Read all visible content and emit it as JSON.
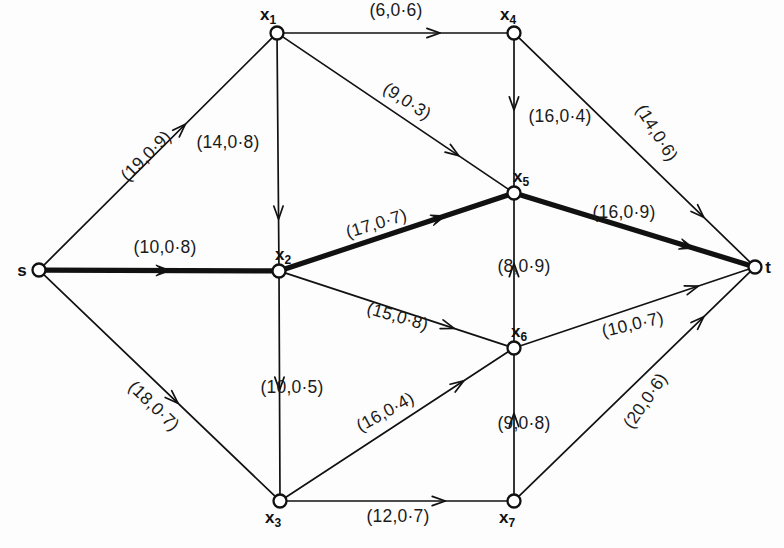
{
  "figure": {
    "type": "directed-network-flow-graph",
    "background_color": "#fdfdfd",
    "ink_color": "#111111",
    "label_format": "(capacity,reliability)",
    "width": 784,
    "height": 548
  },
  "nodes": [
    {
      "id": "s",
      "label": "s",
      "sub": "",
      "x": 39,
      "y": 270,
      "label_dx": -17,
      "label_dy": 6,
      "radius": 6.5
    },
    {
      "id": "x1",
      "label": "x",
      "sub": "1",
      "x": 277,
      "y": 33,
      "label_dx": -9,
      "label_dy": -13,
      "radius": 6.5
    },
    {
      "id": "x2",
      "label": "x",
      "sub": "2",
      "x": 279,
      "y": 271,
      "label_dx": 4,
      "label_dy": -11,
      "radius": 6.5
    },
    {
      "id": "x3",
      "label": "x",
      "sub": "3",
      "x": 280,
      "y": 501,
      "label_dx": -7,
      "label_dy": 22,
      "radius": 6.5
    },
    {
      "id": "x4",
      "label": "x",
      "sub": "4",
      "x": 514,
      "y": 33,
      "label_dx": -6,
      "label_dy": -13,
      "radius": 6.5
    },
    {
      "id": "x5",
      "label": "x",
      "sub": "5",
      "x": 514,
      "y": 193,
      "label_dx": 7,
      "label_dy": -11,
      "radius": 6.5
    },
    {
      "id": "x6",
      "label": "x",
      "sub": "6",
      "x": 514,
      "y": 348,
      "label_dx": 5,
      "label_dy": -11,
      "radius": 6.5
    },
    {
      "id": "x7",
      "label": "x",
      "sub": "7",
      "x": 514,
      "y": 501,
      "label_dx": -7,
      "label_dy": 22,
      "radius": 6.5
    },
    {
      "id": "t",
      "label": "t",
      "sub": "",
      "x": 755,
      "y": 267,
      "label_dx": 13,
      "label_dy": 6,
      "radius": 6.5
    }
  ],
  "edges": [
    {
      "id": "s-x1",
      "from": "s",
      "to": "x1",
      "capacity": 19,
      "reliability": 0.9,
      "label": "(19,0·0·9)",
      "label_text": "(19,0·9)",
      "bold": false,
      "label_x": 150,
      "label_y": 160,
      "rotate": -45,
      "arrow_t": 0.62
    },
    {
      "id": "s-x2",
      "from": "s",
      "to": "x2",
      "capacity": 10,
      "reliability": 0.8,
      "label_text": "(10,0·8)",
      "bold": true,
      "label_x": 165,
      "label_y": 253,
      "rotate": 0,
      "arrow_t": 0.55
    },
    {
      "id": "s-x3",
      "from": "s",
      "to": "x3",
      "capacity": 18,
      "reliability": 0.7,
      "label_text": "(18,0·7)",
      "bold": false,
      "label_x": 150,
      "label_y": 410,
      "rotate": 44,
      "arrow_t": 0.58
    },
    {
      "id": "x1-x4",
      "from": "x1",
      "to": "x4",
      "capacity": 6,
      "reliability": 0.6,
      "label_text": "(6,0·6)",
      "bold": false,
      "label_x": 396,
      "label_y": 16,
      "rotate": 0,
      "arrow_t": 0.7
    },
    {
      "id": "x1-x2",
      "from": "x1",
      "to": "x2",
      "capacity": 14,
      "reliability": 0.8,
      "label_text": "(14,0·8)",
      "bold": false,
      "label_x": 228,
      "label_y": 148,
      "rotate": 0,
      "arrow_t": 0.8
    },
    {
      "id": "x1-x5",
      "from": "x1",
      "to": "x5",
      "capacity": 9,
      "reliability": 0.3,
      "label_text": "(9,0·3)",
      "bold": false,
      "label_x": 404,
      "label_y": 106,
      "rotate": 33,
      "arrow_t": 0.78
    },
    {
      "id": "x4-x5",
      "from": "x4",
      "to": "x5",
      "capacity": 16,
      "reliability": 0.4,
      "label_text": "(16,0·4)",
      "bold": false,
      "label_x": 560,
      "label_y": 122,
      "rotate": 0,
      "arrow_t": 0.48
    },
    {
      "id": "x4-t",
      "from": "x4",
      "to": "t",
      "capacity": 14,
      "reliability": 0.6,
      "label_text": "(14,0·6)",
      "bold": false,
      "label_x": 652,
      "label_y": 136,
      "rotate": 58,
      "arrow_t": 0.8
    },
    {
      "id": "x2-x5",
      "from": "x2",
      "to": "x5",
      "capacity": 17,
      "reliability": 0.7,
      "label_text": "(17,0·7)",
      "bold": true,
      "label_x": 378,
      "label_y": 229,
      "rotate": -17,
      "arrow_t": 0.72
    },
    {
      "id": "x2-x6",
      "from": "x2",
      "to": "x6",
      "capacity": 15,
      "reliability": 0.8,
      "label_text": "(15,0·8)",
      "bold": false,
      "label_x": 396,
      "label_y": 322,
      "rotate": 16,
      "arrow_t": 0.76
    },
    {
      "id": "x2-x3",
      "from": "x2",
      "to": "x3",
      "capacity": 10,
      "reliability": 0.5,
      "label_text": "(10,0·5)",
      "bold": false,
      "label_x": 292,
      "label_y": 393,
      "rotate": 0,
      "arrow_t": 0.52
    },
    {
      "id": "x6-x5",
      "from": "x6",
      "to": "x5",
      "capacity": 8,
      "reliability": 0.9,
      "label_text": "(8,0·9)",
      "bold": false,
      "label_x": 524,
      "label_y": 272,
      "rotate": 0,
      "arrow_t": 0.55
    },
    {
      "id": "x5-t",
      "from": "x5",
      "to": "t",
      "capacity": 16,
      "reliability": 0.9,
      "label_text": "(16,0·9)",
      "bold": true,
      "label_x": 624,
      "label_y": 218,
      "rotate": 0,
      "arrow_t": 0.76
    },
    {
      "id": "x6-t",
      "from": "x6",
      "to": "t",
      "capacity": 10,
      "reliability": 0.7,
      "label_text": "(10,0·7)",
      "bold": false,
      "label_x": 634,
      "label_y": 330,
      "rotate": -13,
      "arrow_t": 0.78
    },
    {
      "id": "x3-x6",
      "from": "x3",
      "to": "x6",
      "capacity": 16,
      "reliability": 0.4,
      "label_text": "(16,0·4)",
      "bold": false,
      "label_x": 388,
      "label_y": 417,
      "rotate": -29,
      "arrow_t": 0.8
    },
    {
      "id": "x3-x7",
      "from": "x3",
      "to": "x7",
      "capacity": 12,
      "reliability": 0.7,
      "label_text": "(12,0·7)",
      "bold": false,
      "label_x": 398,
      "label_y": 522,
      "rotate": 0,
      "arrow_t": 0.72
    },
    {
      "id": "x7-x6",
      "from": "x7",
      "to": "x6",
      "capacity": 9,
      "reliability": 0.8,
      "label_text": "(9,0·8)",
      "bold": false,
      "label_x": 524,
      "label_y": 429,
      "rotate": 0,
      "arrow_t": 0.58
    },
    {
      "id": "x7-t",
      "from": "x7",
      "to": "t",
      "capacity": 20,
      "reliability": 0.6,
      "label_text": "(20,0·6)",
      "bold": false,
      "label_x": 650,
      "label_y": 404,
      "rotate": -55,
      "arrow_t": 0.8
    }
  ],
  "highlighted_path": {
    "description": "bold augmenting path",
    "nodes": [
      "s",
      "x2",
      "x5",
      "t"
    ],
    "edges": [
      "s-x2",
      "x2-x5",
      "x5-t"
    ]
  }
}
